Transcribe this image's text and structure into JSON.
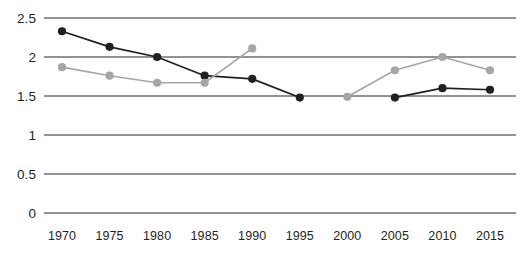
{
  "chart_data": {
    "type": "line",
    "title": "",
    "subtitle": "",
    "xlabel": "",
    "ylabel": "",
    "categories": [
      "1970",
      "1975",
      "1980",
      "1985",
      "1990",
      "1995",
      "2000",
      "2005",
      "2010",
      "2015"
    ],
    "ylim": [
      0,
      2.5
    ],
    "yticks": [
      "0",
      "0.5",
      "1",
      "1.5",
      "2",
      "2.5"
    ],
    "ytick_values": [
      0,
      0.5,
      1,
      1.5,
      2,
      2.5
    ],
    "grid": true,
    "grid_axis": "y",
    "legend": "none",
    "series": [
      {
        "name": "dark-series",
        "color": "#221f1f",
        "marker": "circle",
        "values": [
          2.33,
          2.13,
          2.0,
          1.76,
          1.72,
          1.48,
          null,
          1.48,
          1.6,
          1.58
        ]
      },
      {
        "name": "grey-series",
        "color": "#a6a6a6",
        "marker": "circle",
        "values": [
          1.87,
          1.76,
          1.67,
          1.67,
          2.11,
          null,
          1.49,
          1.83,
          2.0,
          1.83
        ]
      }
    ]
  },
  "axes": {
    "grid_color": "#6d6e71",
    "plot_left": 44,
    "plot_right": 516,
    "plot_top": 18,
    "plot_bottom": 213
  }
}
